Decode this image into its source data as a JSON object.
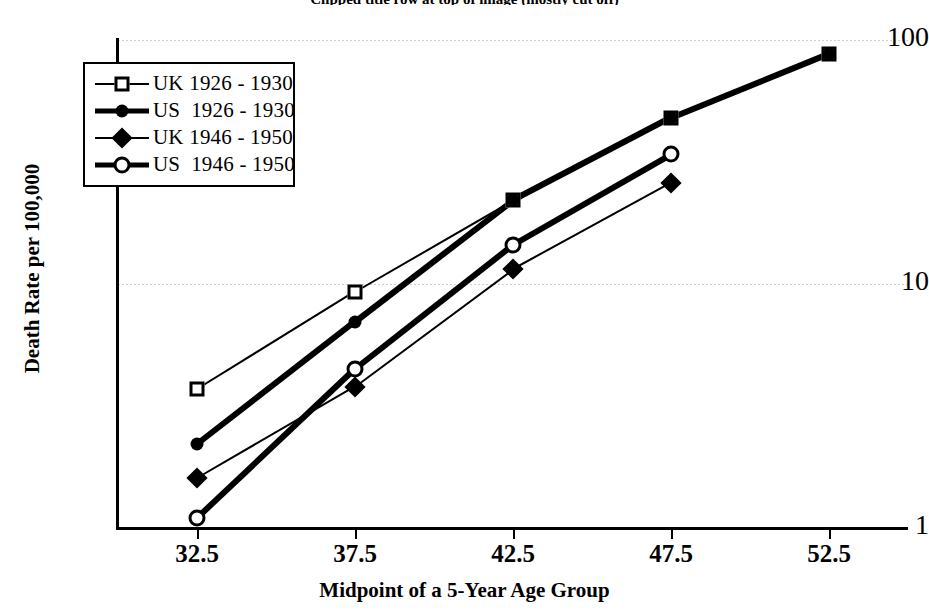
{
  "title": "Clipped title row at top of image (mostly cut off)",
  "axes": {
    "y_label": "Death Rate per 100,000",
    "x_label": "Midpoint of a 5-Year Age Group",
    "y_ticks": [
      "1",
      "10",
      "100"
    ],
    "x_ticks": [
      "32.5",
      "37.5",
      "42.5",
      "47.5",
      "52.5"
    ]
  },
  "legend": {
    "items": [
      {
        "label": "UK 1926 - 1930",
        "marker": "square-open",
        "line": "thin"
      },
      {
        "label": "US  1926 - 1930",
        "marker": "circle-filled",
        "line": "thick"
      },
      {
        "label": "UK 1946 - 1950",
        "marker": "diamond-filled",
        "line": "thin"
      },
      {
        "label": "US  1946 - 1950",
        "marker": "circle-open",
        "line": "thick"
      }
    ]
  },
  "chart_data": {
    "type": "line",
    "xlabel": "Midpoint of a 5-Year Age Group",
    "ylabel": "Death Rate per 100,000",
    "x": [
      32.5,
      37.5,
      42.5,
      47.5,
      52.5
    ],
    "xlim": [
      30,
      55
    ],
    "ylim": [
      1,
      100
    ],
    "yscale": "log",
    "y_ticks": [
      1,
      10,
      100
    ],
    "grid": true,
    "legend_position": "upper left",
    "series": [
      {
        "name": "UK 1926 - 1930",
        "marker": "square-open",
        "line": "thin",
        "x": [
          32.5,
          37.5,
          42.5,
          47.5,
          52.5
        ],
        "values": [
          3.7,
          9.3,
          22,
          48,
          88
        ]
      },
      {
        "name": "US  1926 - 1930",
        "marker": "circle-filled",
        "line": "thick",
        "x": [
          32.5,
          37.5,
          42.5,
          47.5,
          52.5
        ],
        "values": [
          2.2,
          7.0,
          22,
          48,
          88
        ]
      },
      {
        "name": "UK 1946 - 1950",
        "marker": "diamond-filled",
        "line": "thin",
        "x": [
          32.5,
          37.5,
          42.5,
          47.5
        ],
        "values": [
          1.6,
          3.8,
          11.5,
          26
        ]
      },
      {
        "name": "US  1946 - 1950",
        "marker": "circle-open",
        "line": "thick",
        "x": [
          32.5,
          37.5,
          42.5,
          47.5
        ],
        "values": [
          1.1,
          4.5,
          14.5,
          34
        ]
      }
    ]
  },
  "colors": {
    "ink": "#000000",
    "grid": "#cfcfcf",
    "background": "#ffffff"
  }
}
